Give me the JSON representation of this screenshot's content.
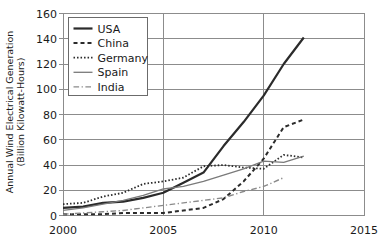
{
  "chart_data": {
    "type": "line",
    "title": "",
    "xlabel": "",
    "ylabel": "Annual Wind Electrical Generation\n(Billion Kilowatt-Hours)",
    "ylabel_line1": "Annual Wind Electrical Generation",
    "ylabel_line2": "(Billion Kilowatt-Hours)",
    "xlim": [
      2000,
      2015
    ],
    "ylim": [
      0,
      160
    ],
    "xticks": [
      2000,
      2005,
      2010,
      2015
    ],
    "xtick_labels": [
      "2000",
      "2005",
      "2010",
      "2015"
    ],
    "yticks": [
      0,
      20,
      40,
      60,
      80,
      100,
      120,
      140,
      160
    ],
    "ytick_labels": [
      "0",
      "20",
      "40",
      "60",
      "80",
      "100",
      "120",
      "140",
      "160"
    ],
    "grid": "horizontal-and-vertical",
    "legend_position": "top-left-inside",
    "series": [
      {
        "name": "USA",
        "style": "solid",
        "color": "#2b2b2b",
        "width": 2.2,
        "x": [
          2000,
          2001,
          2002,
          2003,
          2004,
          2005,
          2006,
          2007,
          2008,
          2009,
          2010,
          2011,
          2012
        ],
        "values": [
          6,
          7,
          10,
          11,
          14,
          18,
          26,
          34,
          55,
          74,
          95,
          120,
          141
        ]
      },
      {
        "name": "China",
        "style": "dashed",
        "color": "#2b2b2b",
        "width": 2.0,
        "x": [
          2000,
          2001,
          2002,
          2003,
          2004,
          2005,
          2006,
          2007,
          2008,
          2009,
          2010,
          2011,
          2012
        ],
        "values": [
          1,
          1,
          1,
          2,
          2,
          2,
          4,
          6,
          13,
          27,
          45,
          70,
          76
        ]
      },
      {
        "name": "Germany",
        "style": "dotted",
        "color": "#2b2b2b",
        "width": 1.8,
        "x": [
          2000,
          2001,
          2002,
          2003,
          2004,
          2005,
          2006,
          2007,
          2008,
          2009,
          2010,
          2011,
          2012
        ],
        "values": [
          9,
          10,
          15,
          18,
          25,
          27,
          30,
          39,
          40,
          38,
          37,
          48,
          46
        ]
      },
      {
        "name": "Spain",
        "style": "solid-thin",
        "color": "#7a7a7a",
        "width": 1.3,
        "x": [
          2000,
          2001,
          2002,
          2003,
          2004,
          2005,
          2006,
          2007,
          2008,
          2009,
          2010,
          2011,
          2012
        ],
        "values": [
          4,
          6,
          9,
          12,
          16,
          21,
          23,
          27,
          32,
          37,
          43,
          42,
          47
        ]
      },
      {
        "name": "India",
        "style": "dashdot",
        "color": "#8a8a8a",
        "width": 1.4,
        "x": [
          2000,
          2001,
          2002,
          2003,
          2004,
          2005,
          2006,
          2007,
          2008,
          2009,
          2010,
          2011
        ],
        "values": [
          1,
          2,
          3,
          4,
          6,
          8,
          10,
          12,
          14,
          19,
          23,
          30
        ]
      }
    ],
    "legend_entries": [
      "USA",
      "China",
      "Germany",
      "Spain",
      "India"
    ]
  }
}
